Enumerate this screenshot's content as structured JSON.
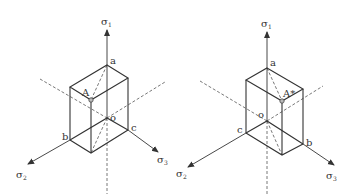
{
  "figure": {
    "colors": {
      "line": "#333333",
      "dash": "#555555",
      "point_fill": "#bbbbbb"
    },
    "left": {
      "axes": {
        "vertical": "σ",
        "vertical_sub": "1",
        "left": "σ",
        "left_sub": "2",
        "right": "σ",
        "right_sub": "3"
      },
      "vertices": {
        "top": "a",
        "left": "b",
        "right": "c",
        "origin": "o",
        "point": "A"
      }
    },
    "right": {
      "axes": {
        "vertical": "σ",
        "vertical_sub": "1",
        "left": "σ",
        "left_sub": "2",
        "right": "σ",
        "right_sub": "3"
      },
      "vertices": {
        "top": "a",
        "left": "c",
        "right": "b",
        "origin": "o",
        "point": "A*"
      }
    }
  }
}
